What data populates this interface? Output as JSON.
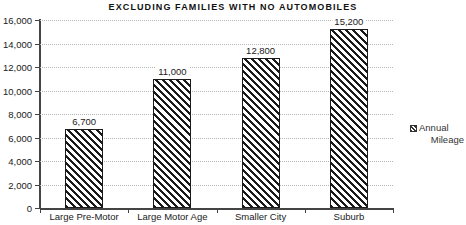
{
  "chart_data": {
    "type": "bar",
    "title": "EXCLUDING FAMILIES WITH NO AUTOMOBILES",
    "xlabel": "",
    "ylabel": "",
    "categories": [
      "Large Pre-Motor",
      "Large Motor Age",
      "Smaller City",
      "Suburb"
    ],
    "values": [
      6700,
      11000,
      12800,
      15200
    ],
    "value_labels": [
      "6,700",
      "11,000",
      "12,800",
      "15,200"
    ],
    "series": [
      {
        "name": "Annual Mileage",
        "values": [
          6700,
          11000,
          12800,
          15200
        ]
      }
    ],
    "ylim": [
      0,
      16000
    ],
    "ytick_values": [
      0,
      2000,
      4000,
      6000,
      8000,
      10000,
      12000,
      14000,
      16000
    ],
    "ytick_labels": [
      "0",
      "2,000",
      "4,000",
      "6,000",
      "8,000",
      "10,000",
      "12,000",
      "14,000",
      "16,000"
    ],
    "grid": "horizontal-dotted",
    "legend_position": "right",
    "legend": [
      {
        "swatch": "hatched-diagonal-swatch",
        "line1": "Annual",
        "line2": "Mileage"
      }
    ],
    "bar_fill": "diagonal-hatch",
    "colors": {
      "background": "#ffffff",
      "bar_line": "#1a1a1a",
      "axis": "#444444",
      "gridline": "#b4b4b4",
      "text": "#1a1a1a"
    }
  }
}
